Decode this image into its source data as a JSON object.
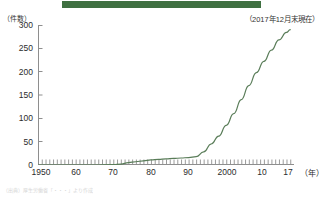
{
  "banner": {
    "color": "#3f7041"
  },
  "note": "（2017年12月末現在）",
  "source": "（出典）厚生労働省「・・・」より作成",
  "chart_data": {
    "type": "line",
    "title": "",
    "subtitle": "",
    "annotation": "（2017年12月末現在）",
    "xlabel": "（年）",
    "ylabel": "（件数）",
    "grid": false,
    "legend": "none",
    "line_color": "#5a7d59",
    "xlim": [
      1950,
      2018
    ],
    "ylim": [
      0,
      300
    ],
    "yticks": [
      0,
      50,
      100,
      150,
      200,
      250,
      300
    ],
    "ytick_labels": [
      "0",
      "50",
      "100",
      "150",
      "200",
      "250",
      "300"
    ],
    "xticks": [
      1950,
      1960,
      1970,
      1980,
      1990,
      2000,
      2010,
      2017
    ],
    "xtick_labels": [
      "1950",
      "60",
      "70",
      "80",
      "90",
      "2000",
      "10",
      "17"
    ],
    "minor_tick_interval": 1,
    "x": [
      1950,
      1955,
      1960,
      1965,
      1970,
      1972,
      1974,
      1976,
      1978,
      1980,
      1982,
      1984,
      1986,
      1988,
      1990,
      1992,
      1994,
      1996,
      1998,
      2000,
      2002,
      2004,
      2006,
      2008,
      2010,
      2012,
      2014,
      2016,
      2017
    ],
    "values": [
      0,
      0,
      0,
      0,
      1,
      2,
      5,
      7,
      9,
      11,
      12,
      13,
      14,
      15,
      16,
      18,
      28,
      45,
      62,
      85,
      110,
      140,
      170,
      198,
      222,
      246,
      268,
      284,
      290
    ]
  }
}
